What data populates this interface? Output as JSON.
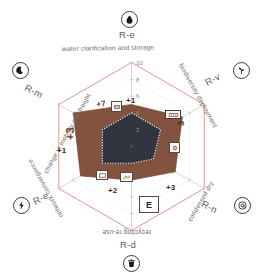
{
  "chart_data": {
    "type": "radar",
    "title": "",
    "axis_range": [
      0,
      10
    ],
    "tick_labels": [
      "0",
      "2",
      "4",
      "6",
      "8",
      "10"
    ],
    "grid": true,
    "legend_position": "none",
    "categories": [
      {
        "code": "R-e",
        "description": "water clarification and storage",
        "icon": "water-droplet-icon",
        "angle": 270
      },
      {
        "code": "R-v",
        "description": "biodiversity deployment",
        "icon": "plant-sprout-icon",
        "angle": 330
      },
      {
        "code": "R-n",
        "description": "condensed dry",
        "icon": "at-sign-icon",
        "angle": 30
      },
      {
        "code": "R-d",
        "description": "recycling re-use",
        "icon": "trash-bin-icon",
        "angle": 90
      },
      {
        "code": "R-e",
        "description": "network convergence",
        "icon": "lightning-bolt-icon",
        "angle": 150
      },
      {
        "code": "R-m",
        "description": "change in mobility and freight",
        "icon": "crescent-moon-icon",
        "angle": 210
      }
    ],
    "series": [
      {
        "name": "maximum",
        "color": "#e8897a",
        "fill": "none",
        "values": [
          10,
          10,
          10,
          10,
          10,
          10
        ]
      },
      {
        "name": "outer",
        "color": "#7a4430",
        "fill": "#7a4430",
        "values": [
          5,
          7,
          6,
          4,
          7,
          8
        ]
      },
      {
        "name": "inner",
        "color": "#2b3340",
        "fill": "#2b3340",
        "values": [
          4,
          4,
          3,
          2,
          4,
          4
        ]
      }
    ],
    "annotations": [
      {
        "label": "+1",
        "axis": "R-e-top"
      },
      {
        "label": "+7",
        "axis": "R-m-upper-left"
      },
      {
        "label": "+3",
        "axis": "R-m-left"
      },
      {
        "label": "+1",
        "axis": "R-e-network"
      },
      {
        "label": "+2",
        "axis": "R-d-bottom-left"
      },
      {
        "label": "+3",
        "axis": "R-n-lower-right"
      },
      {
        "label": "3",
        "axis": "R-v-right"
      }
    ],
    "marker_box": "E"
  },
  "colors": {
    "max_ring": "#e8897a",
    "outer_polygon": "#7a4430",
    "inner_polygon": "#2b3340",
    "grid": "#9a9a9a",
    "text": "#5b5b5b",
    "background": "#ffffff"
  }
}
